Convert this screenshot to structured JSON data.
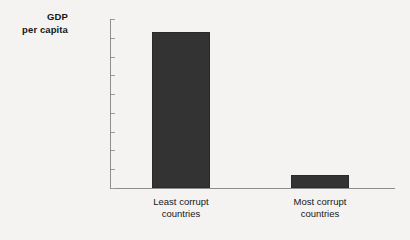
{
  "chart_data": {
    "type": "bar",
    "title": "",
    "subtitle": "",
    "xlabel": "",
    "ylabel": "GDP per capita",
    "ylabel_line1": "GDP",
    "ylabel_line2": "per capita",
    "categories": [
      "Least corrupt countries",
      "Most corrupt countries"
    ],
    "category_lines": [
      [
        "Least corrupt",
        "countries"
      ],
      [
        "Most corrupt",
        "countries"
      ]
    ],
    "values": [
      41500,
      3500
    ],
    "ylim": [
      0,
      45000
    ],
    "ytick_values": [
      0,
      5000,
      10000,
      15000,
      20000,
      25000,
      30000,
      35000,
      40000,
      45000
    ],
    "ytick_labels": [
      "0",
      "5,000",
      "10,000",
      "15,000",
      "20,000",
      "25,000",
      "30,000",
      "35,000",
      "40,000",
      "$45,000"
    ],
    "grid": false,
    "legend": false,
    "legend_position": "none",
    "bar_color": "#333333",
    "axis_color": "#8d8d8d",
    "background_color": "#f4f3f1",
    "text_color": "#171717"
  }
}
